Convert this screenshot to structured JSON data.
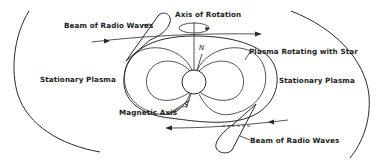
{
  "diagram": {
    "labels": {
      "beam_top": "Beam of Radio Waves",
      "axis_of_rotation": "Axis of Rotation",
      "plasma_rotating": "Plasma Rotating with Star",
      "stationary_left": "Stationary Plasma",
      "stationary_right": "Stationary Plasma",
      "magnetic_axis": "Magnetic Axis",
      "beam_bottom": "Beam of Radio Waves",
      "north_pole": "N",
      "south_pole": "S"
    },
    "colors": {
      "line": "#2a2a2a",
      "text": "#222222",
      "background": "#ffffff"
    }
  }
}
